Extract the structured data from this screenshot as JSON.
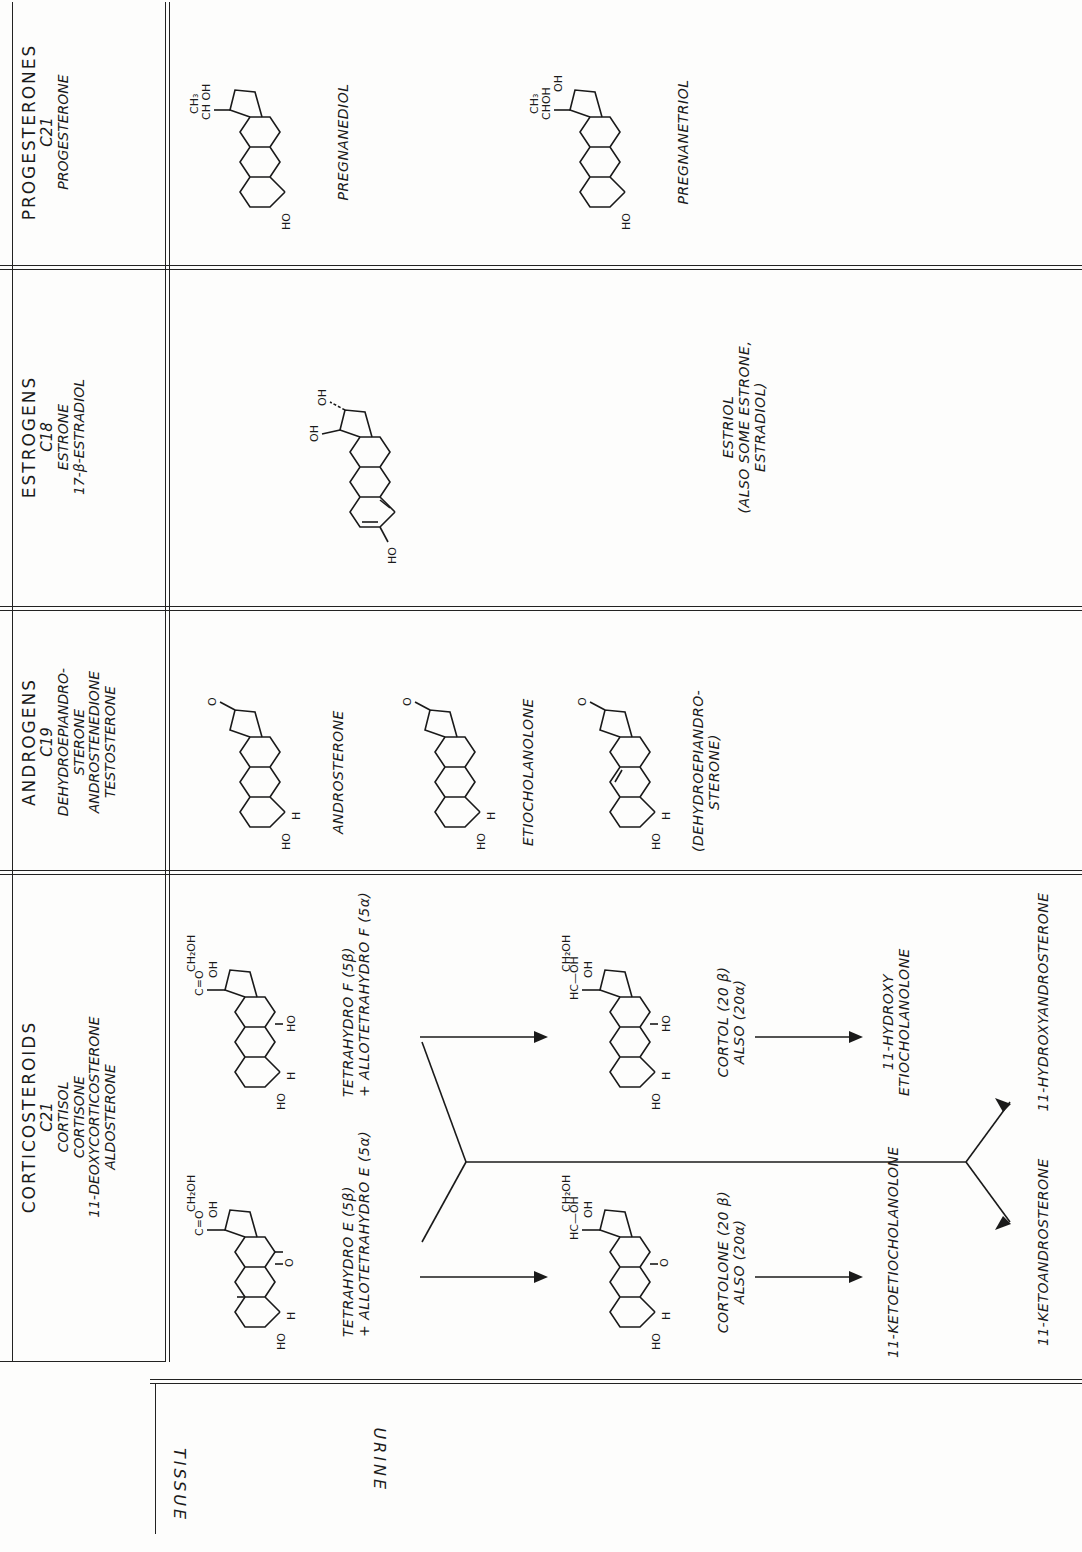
{
  "side_labels": {
    "tissue": "TISSUE",
    "urine": "URINE"
  },
  "columns": [
    {
      "class": "CORTICOSTEROIDS",
      "carbon": "C21",
      "hormones": [
        "CORTISOL",
        "CORTISONE",
        "11-DEOXYCORTICOSTERONE",
        "ALDOSTERONE"
      ]
    },
    {
      "class": "ANDROGENS",
      "carbon": "C19",
      "hormones": [
        "DEHYDROEPIANDRO-",
        "STERONE",
        "ANDROSTENEDIONE",
        "TESTOSTERONE"
      ]
    },
    {
      "class": "ESTROGENS",
      "carbon": "C18",
      "hormones": [
        "ESTRONE",
        "17-β-ESTRADIOL"
      ]
    },
    {
      "class": "PROGESTERONES",
      "carbon": "C21",
      "hormones": [
        "PROGESTERONE"
      ]
    }
  ],
  "corticosteroids": {
    "tetrahydro_e": [
      "TETRAHYDRO E (5β)",
      "+ ALLOTETRAHYDRO E (5α)"
    ],
    "tetrahydro_f": [
      "TETRAHYDRO F (5β)",
      "+ ALLOTETRAHYDRO F (5α)"
    ],
    "cortolone": [
      "CORTOLONE (20 β)",
      "ALSO (20α)"
    ],
    "cortol": [
      "CORTOL (20 β)",
      "ALSO (20α)"
    ],
    "keto_etio": "11-KETOETIOCHOLANOLONE",
    "hydroxy_etio": [
      "11-HYDROXY",
      "ETIOCHOLANOLONE"
    ],
    "keto_andro": "11-KETOANDROSTERONE",
    "hydroxy_andro": "11-HYDROXYANDROSTERONE",
    "groups": {
      "ch2oh": "CH₂OH",
      "co": "C=O",
      "hc_oh": "HC—OH",
      "oh": "OH",
      "ho": "HO",
      "o": "O",
      "h": "H"
    }
  },
  "androgens": {
    "metabolites": [
      "ANDROSTERONE",
      "ETIOCHOLANOLONE",
      "(DEHYDROEPIANDRO-",
      "STERONE)"
    ]
  },
  "estrogens": {
    "metabolite": "ESTRIOL",
    "note": [
      "(ALSO SOME ESTRONE,",
      "ESTRADIOL)"
    ]
  },
  "progesterones": {
    "metabolites": [
      "PREGNANEDIOL",
      "PREGNANETRIOL"
    ],
    "groups": {
      "ch3": "CH₃",
      "choh": "CHOH",
      "ch_oh": "CH OH"
    }
  }
}
